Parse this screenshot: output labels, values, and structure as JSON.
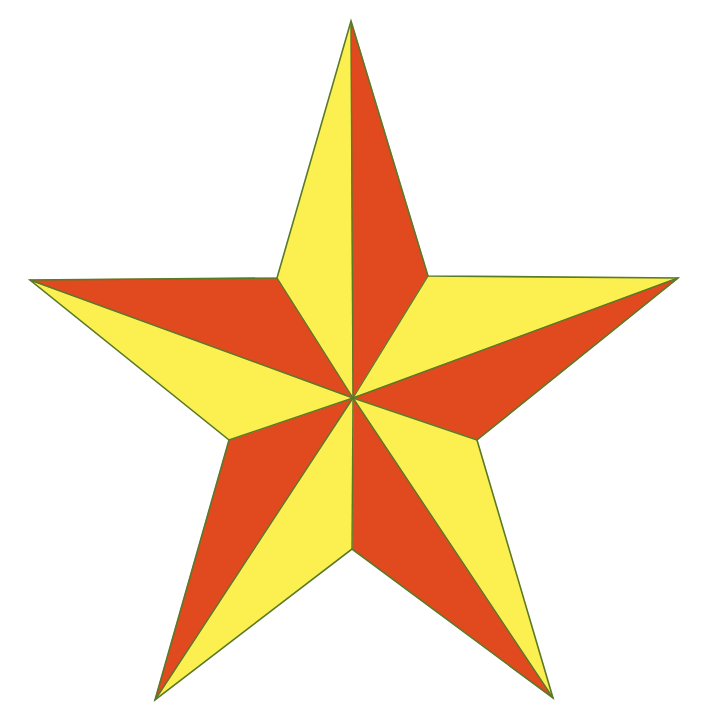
{
  "image": {
    "subject": "five-pointed nautical star",
    "background": "#ffffff",
    "colors": {
      "yellow": "#FCF050",
      "red": "#E04A1E",
      "edge": "#5A7A2A"
    },
    "center": [
      353,
      398
    ],
    "outer_points": {
      "top": [
        351,
        21
      ],
      "right": [
        678,
        278
      ],
      "bottom_right": [
        553,
        698
      ],
      "bottom_left": [
        155,
        700
      ],
      "left": [
        30,
        280
      ]
    },
    "inner_points": {
      "upper_right": [
        428,
        276
      ],
      "lower_right": [
        477,
        440
      ],
      "bottom": [
        352,
        549
      ],
      "lower_left": [
        229,
        440
      ],
      "upper_left": [
        277,
        278
      ]
    },
    "facets": [
      {
        "name": "top-left-facet",
        "color": "yellow",
        "points": "353,398 351,21 277,278"
      },
      {
        "name": "top-right-facet",
        "color": "red",
        "points": "353,398 351,21 428,276"
      },
      {
        "name": "right-upper-facet",
        "color": "yellow",
        "points": "353,398 678,278 428,276"
      },
      {
        "name": "right-lower-facet",
        "color": "red",
        "points": "353,398 678,278 477,440"
      },
      {
        "name": "bottom-right-outer-facet",
        "color": "yellow",
        "points": "353,398 553,698 477,440"
      },
      {
        "name": "bottom-right-inner-facet",
        "color": "red",
        "points": "353,398 553,698 352,549"
      },
      {
        "name": "bottom-left-inner-facet",
        "color": "yellow",
        "points": "353,398 155,700 352,549"
      },
      {
        "name": "bottom-left-outer-facet",
        "color": "red",
        "points": "353,398 155,700 229,440"
      },
      {
        "name": "left-lower-facet",
        "color": "yellow",
        "points": "353,398 30,280 229,440"
      },
      {
        "name": "left-upper-facet",
        "color": "red",
        "points": "353,398 30,280 277,278"
      }
    ]
  }
}
